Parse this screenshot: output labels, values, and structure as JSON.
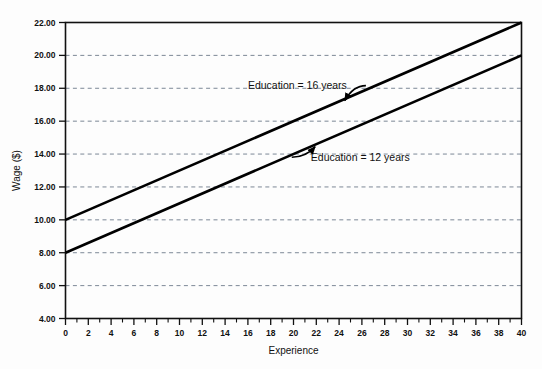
{
  "chart_data": {
    "type": "line",
    "title": "",
    "xlabel": "Experience",
    "ylabel": "Wage ($)",
    "xlim": [
      0,
      40
    ],
    "ylim": [
      4.0,
      22.0
    ],
    "grid": true,
    "grid_axis": "y",
    "legend_position": "none",
    "x_ticks": [
      0,
      2,
      4,
      6,
      8,
      10,
      12,
      14,
      16,
      18,
      20,
      22,
      24,
      26,
      28,
      30,
      32,
      34,
      36,
      38,
      40
    ],
    "x_tick_labels": [
      "0",
      "2",
      "4",
      "6",
      "8",
      "10",
      "12",
      "14",
      "16",
      "18",
      "20",
      "22",
      "24",
      "26",
      "28",
      "30",
      "32",
      "34",
      "36",
      "38",
      "40"
    ],
    "x_minor_ticks": [
      1,
      3,
      5,
      7,
      9,
      11,
      13,
      15,
      17,
      19,
      21,
      23,
      25,
      27,
      29,
      31,
      33,
      35,
      37,
      39
    ],
    "y_ticks": [
      4.0,
      6.0,
      8.0,
      10.0,
      12.0,
      14.0,
      16.0,
      18.0,
      20.0,
      22.0
    ],
    "y_tick_labels": [
      "4.00",
      "6.00",
      "8.00",
      "10.00",
      "12.00",
      "14.00",
      "16.00",
      "18.00",
      "20.00",
      "22.00"
    ],
    "series": [
      {
        "name": "Education = 16 years",
        "color": "#000000",
        "intercept": 10.0,
        "slope": 0.3,
        "x": [
          0,
          40
        ],
        "values": [
          10.0,
          22.0
        ]
      },
      {
        "name": "Education = 12 years",
        "color": "#000000",
        "intercept": 8.0,
        "slope": 0.3,
        "x": [
          0,
          40
        ],
        "values": [
          8.0,
          20.0
        ]
      }
    ],
    "annotations": [
      {
        "text": "Education = 16 years",
        "text_x": 16.0,
        "text_y": 17.95,
        "target_x": 24.5,
        "target_y": 17.25
      },
      {
        "text": "Education = 12 years",
        "text_x": 30.2,
        "text_y": 13.6,
        "target_x": 21.9,
        "target_y": 14.45
      }
    ]
  },
  "axes": {
    "x_axis_title": "Experience",
    "y_axis_title": "Wage ($)"
  },
  "colors": {
    "line": "#000000",
    "grid": "#6d7a8a",
    "axis": "#111111",
    "background": "#fdfdfd"
  }
}
